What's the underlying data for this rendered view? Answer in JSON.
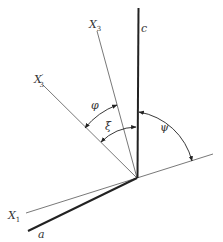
{
  "diagram": {
    "type": "geometric-angle-diagram",
    "axes": {
      "c": {
        "label": "c",
        "style": "thick"
      },
      "a": {
        "label": "a",
        "style": "thick"
      },
      "x3": {
        "label": "X",
        "subscript": "3",
        "style": "thin"
      },
      "x3_prime": {
        "label": "X",
        "subscript": "3",
        "prime": "′",
        "style": "thin"
      },
      "x1": {
        "label": "X",
        "subscript": "1",
        "style": "thin"
      }
    },
    "angles": {
      "phi": {
        "label": "φ",
        "between": [
          "X3'",
          "X3"
        ]
      },
      "xi": {
        "label": "ξ",
        "between": [
          "X3'",
          "c"
        ]
      },
      "psi": {
        "label": "ψ",
        "between": [
          "c",
          "X1"
        ]
      }
    },
    "colors": {
      "line": "#222222",
      "thin_line": "#555555",
      "text": "#333333"
    }
  }
}
